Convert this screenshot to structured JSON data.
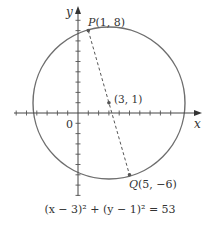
{
  "diagram": {
    "type": "circle-graph",
    "axes": {
      "x_label": "x",
      "y_label": "y",
      "origin_label": "0",
      "unit_px": 10.3,
      "x_ticks_left": 6,
      "x_ticks_right": 9,
      "y_ticks_up": 9,
      "y_ticks_down": 8
    },
    "circle": {
      "center": [
        3,
        1
      ],
      "center_label": "(3, 1)",
      "radius_squared": 53,
      "stroke_color": "#6e6e6e"
    },
    "points": [
      {
        "name": "P",
        "coords": [
          1,
          8
        ],
        "label_letter": "P",
        "label_coords": "(1, 8)"
      },
      {
        "name": "Q",
        "coords": [
          5,
          -6
        ],
        "label_letter": "Q",
        "label_coords": "(5, −6)"
      }
    ],
    "segment": {
      "from": "P",
      "to": "Q",
      "style": "dashed"
    },
    "equation": "(x − 3)² + (y − 1)² = 53",
    "colors": {
      "axis": "#444444",
      "circle": "#6e6e6e",
      "dashed": "#555555",
      "text": "#333333"
    }
  }
}
